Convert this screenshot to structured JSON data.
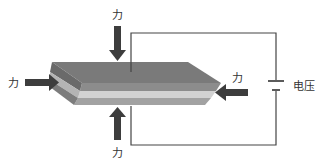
{
  "diagram": {
    "title": "",
    "labels": {
      "force_top": "力",
      "force_bottom": "力",
      "force_left": "力",
      "force_right": "力",
      "voltage": "电压"
    },
    "colors": {
      "top_face": "#7a7a7a",
      "front_dark": "#8a8a8a",
      "front_light": "#c8c8c8",
      "front_mid": "#a6a6a6",
      "end_face_dark": "#6e6e6e",
      "end_face_light": "#b0b0b0",
      "arrow": "#3d3d3d",
      "wire": "#444444"
    }
  }
}
